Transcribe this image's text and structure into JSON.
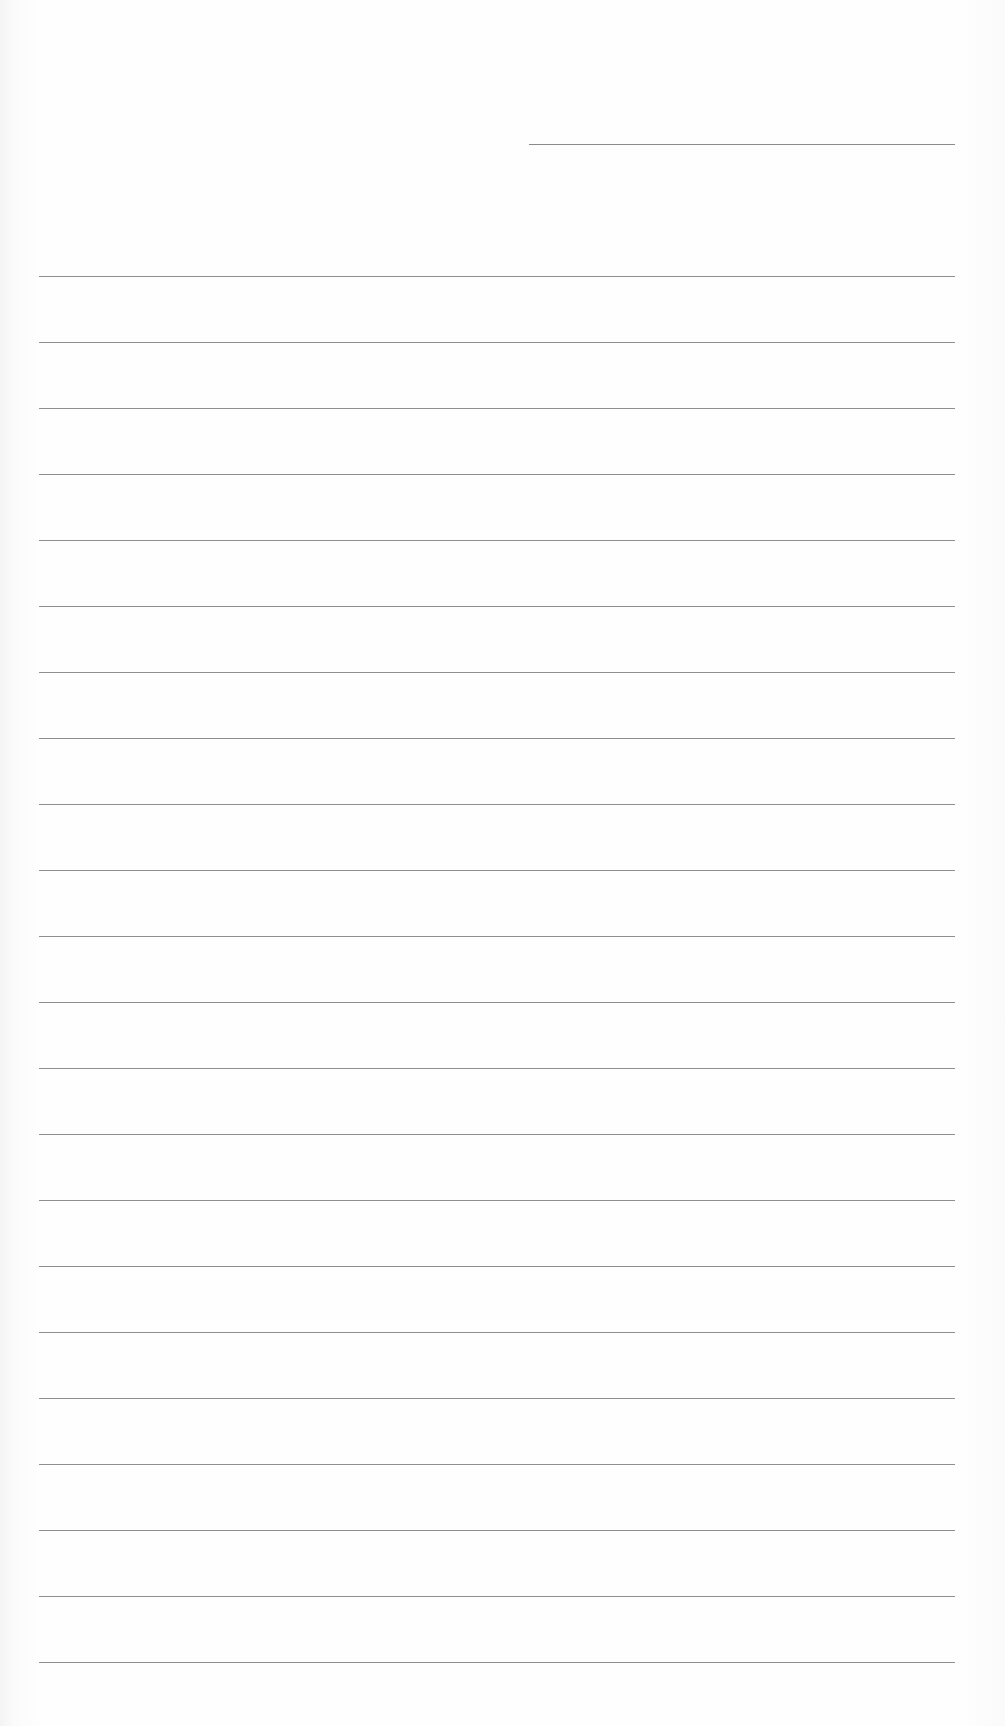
{
  "document": {
    "type": "lined-paper",
    "top_field": {
      "value": ""
    },
    "ruled_lines": {
      "count": 22,
      "first_y": 276,
      "spacing": 66,
      "line_color": "#8e8e8e"
    },
    "background_color": "#fdfdfd"
  }
}
